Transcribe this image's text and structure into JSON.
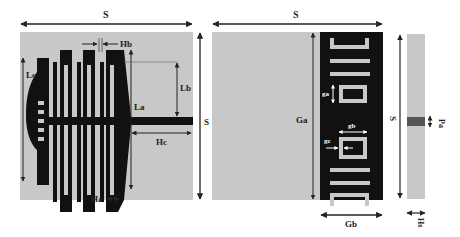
{
  "colors": {
    "substrate": "#c8c8c8",
    "metal": "#111111",
    "slot": "#c8c8c8",
    "feed_port": "#555555",
    "dimension_line": "#222222",
    "background": "#ffffff"
  },
  "panels": {
    "front": {
      "title": "Front view (radiating patch)",
      "labels": {
        "S_top": "S",
        "S_right": "S",
        "Lc": "Lc",
        "La": "La",
        "Lb": "Lb",
        "Hb": "Hb",
        "Hc": "Hc",
        "Ha": "Ha"
      }
    },
    "back": {
      "title": "Back view (ground plane with slots)",
      "labels": {
        "S_top": "S",
        "S_right": "S",
        "Ga": "Ga",
        "Gb": "Gb",
        "ga": "ga",
        "gb": "gb",
        "gc": "gc"
      }
    },
    "side": {
      "title": "Side view",
      "labels": {
        "S_left": "S",
        "Pa": "Pa",
        "Hs": "Hs"
      }
    }
  }
}
